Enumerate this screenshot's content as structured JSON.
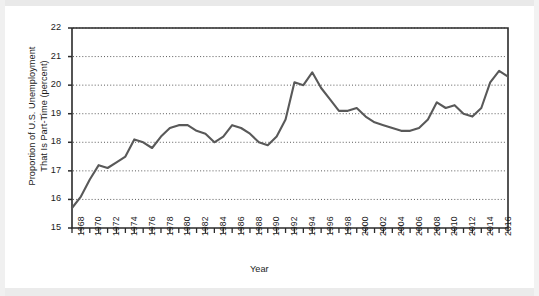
{
  "chart_data": {
    "type": "line",
    "title": "",
    "xlabel": "Year",
    "ylabel_line1": "Proportion of U.S. Unemployment",
    "ylabel_line2": "That Is Part-Time (percent)",
    "ylim": [
      15,
      22
    ],
    "yticks": [
      15,
      16,
      17,
      18,
      19,
      20,
      21,
      22
    ],
    "xlim": [
      1968,
      2017
    ],
    "xticks": [
      1968,
      1969,
      1970,
      1971,
      1972,
      1973,
      1974,
      1975,
      1976,
      1977,
      1978,
      1979,
      1980,
      1981,
      1982,
      1983,
      1984,
      1985,
      1986,
      1987,
      1988,
      1989,
      1990,
      1991,
      1992,
      1993,
      1994,
      1995,
      1996,
      1997,
      1998,
      1999,
      2000,
      2001,
      2002,
      2003,
      2004,
      2005,
      2006,
      2007,
      2008,
      2009,
      2010,
      2011,
      2012,
      2013,
      2014,
      2015,
      2016,
      2017
    ],
    "xtick_labels": [
      "1968",
      "1970",
      "1972",
      "1974",
      "1976",
      "1978",
      "1980",
      "1982",
      "1984",
      "1986",
      "1988",
      "1990",
      "1992",
      "1994",
      "1996",
      "1998",
      "2000",
      "2002",
      "2004",
      "2006",
      "2008",
      "2010",
      "2012",
      "2014",
      "2016"
    ],
    "xtick_labels_years": [
      1968,
      1970,
      1972,
      1974,
      1976,
      1978,
      1980,
      1982,
      1984,
      1986,
      1988,
      1990,
      1992,
      1994,
      1996,
      1998,
      2000,
      2002,
      2004,
      2006,
      2008,
      2010,
      2012,
      2014,
      2016
    ],
    "grid": true,
    "grid_style": "dotted-horizontal",
    "legend": "none",
    "line_color": "#595959",
    "x": [
      1968,
      1969,
      1970,
      1971,
      1972,
      1973,
      1974,
      1975,
      1976,
      1977,
      1978,
      1979,
      1980,
      1981,
      1982,
      1983,
      1984,
      1985,
      1986,
      1987,
      1988,
      1989,
      1990,
      1991,
      1992,
      1993,
      1994,
      1995,
      1996,
      1997,
      1998,
      1999,
      2000,
      2001,
      2002,
      2003,
      2004,
      2005,
      2006,
      2007,
      2008,
      2009,
      2010,
      2011,
      2012,
      2013,
      2014,
      2015,
      2016,
      2017
    ],
    "y": [
      15.7,
      16.1,
      16.7,
      17.2,
      17.1,
      17.3,
      17.5,
      18.1,
      18.0,
      17.8,
      18.2,
      18.5,
      18.6,
      18.6,
      18.4,
      18.3,
      18.0,
      18.2,
      18.6,
      18.5,
      18.3,
      18.0,
      17.9,
      18.2,
      18.8,
      20.1,
      20.0,
      20.45,
      19.9,
      19.5,
      19.1,
      19.1,
      19.2,
      18.9,
      18.7,
      18.6,
      18.5,
      18.4,
      18.4,
      18.5,
      18.8,
      19.4,
      19.2,
      19.3,
      19.0,
      18.9,
      19.2,
      20.1,
      20.5,
      20.3
    ],
    "series_note": "Annual proportion of U.S. unemployment that is part-time, 1968-2017"
  },
  "axis": {
    "x_axis_title": "Year"
  }
}
